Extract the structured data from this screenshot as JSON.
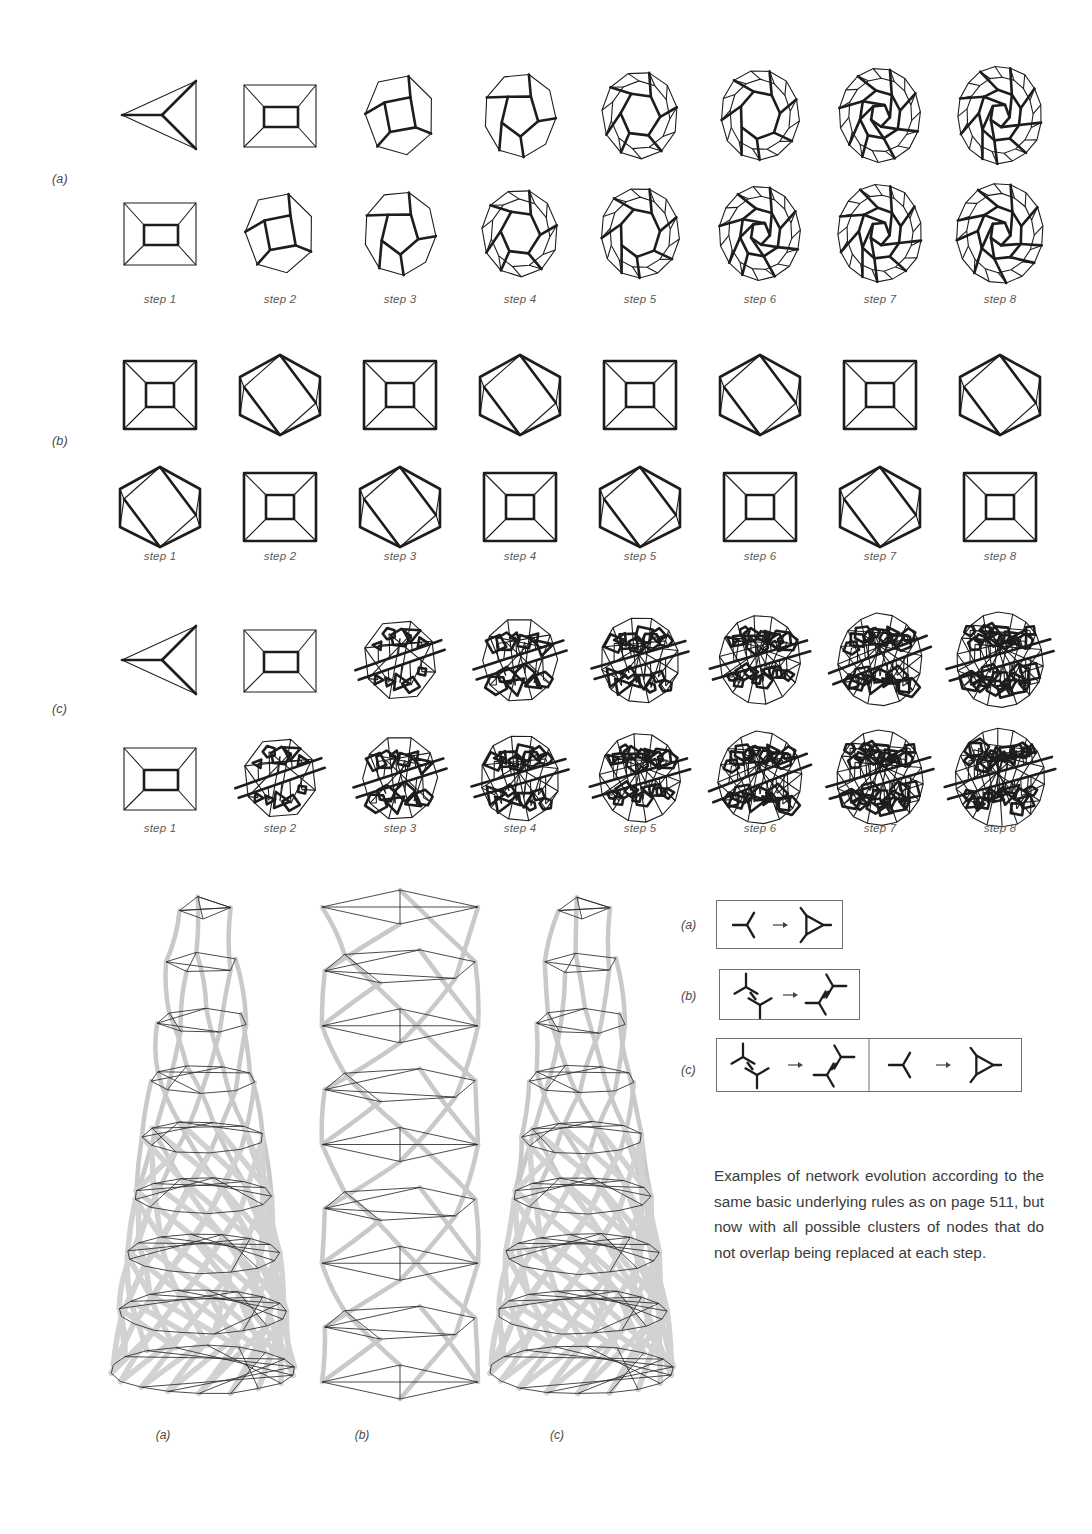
{
  "page": {
    "background": "#ffffff",
    "ink": "#1d1d1d",
    "tube_color": "#c9c9c9",
    "label_color": "#4a4a4a"
  },
  "evolution_rows": [
    {
      "label": "(a)",
      "steps": [
        "step 1",
        "step 2",
        "step 3",
        "step 4",
        "step 5",
        "step 6",
        "step 7",
        "step 8"
      ],
      "description": "triangle grows into sphere-like polygonal network"
    },
    {
      "label": "(b)",
      "steps": [
        "step 1",
        "step 2",
        "step 3",
        "step 4",
        "step 5",
        "step 6",
        "step 7",
        "step 8"
      ],
      "description": "alternates periodically between square-framed and hexagonal forms"
    },
    {
      "label": "(c)",
      "steps": [
        "step 1",
        "step 2",
        "step 3",
        "step 4",
        "step 5",
        "step 6",
        "step 7",
        "step 8"
      ],
      "description": "irregular network growing into banded sphere"
    }
  ],
  "columns_3d": {
    "labels": [
      "(a)",
      "(b)",
      "(c)"
    ]
  },
  "rules": [
    {
      "label": "(a)",
      "arrow": "→",
      "panels": 1,
      "description": "single node with three edges becomes a triangle"
    },
    {
      "label": "(b)",
      "arrow": "→",
      "panels": 1,
      "description": "two joined nodes swap their connection orientation"
    },
    {
      "label": "(c)",
      "arrow": "→",
      "panels": 2,
      "description": "two-node cluster rotates; single node becomes a triangle"
    }
  ],
  "caption": {
    "text": "Examples of network evolution according to the same basic underlying rules as on page 511, but now with all possible clusters of nodes that do not overlap being replaced at each step."
  }
}
